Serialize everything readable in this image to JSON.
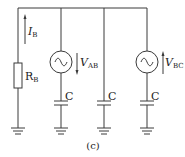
{
  "diagram": {
    "type": "circuit",
    "caption": "(c)",
    "current": {
      "symbol": "I",
      "subscript": "B",
      "direction": "up"
    },
    "resistor": {
      "symbol": "R",
      "subscript": "B"
    },
    "sources": [
      {
        "symbol": "V",
        "subscript": "AB",
        "arrow": "down",
        "glyph": "~"
      },
      {
        "symbol": "V",
        "subscript": "BC",
        "arrow": "up",
        "glyph": "~"
      }
    ],
    "capacitors": [
      {
        "label": "C"
      },
      {
        "label": "C"
      },
      {
        "label": "C"
      }
    ],
    "colors": {
      "line": "#3a3a3a",
      "text": "#222222",
      "background": "#ffffff"
    }
  }
}
